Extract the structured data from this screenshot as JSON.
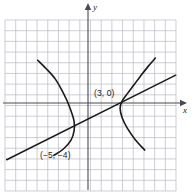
{
  "figure": {
    "title": "",
    "background_color": "#ffffff",
    "ink_color": "#1a1a1a",
    "grid_color": "#b9b9c4",
    "axis_color": "#4a4a52"
  },
  "axes": {
    "x_label": "x",
    "y_label": "y",
    "x_arrow": "arrow-right",
    "y_arrow": "arrow-up",
    "origin_px": {
      "x": 88,
      "y": 103
    },
    "unit_px": 10.7,
    "grid": {
      "visible": true,
      "left_px": 5,
      "top_px": 20,
      "right_px": 176,
      "bottom_px": 191,
      "columns": 16,
      "rows": 16
    }
  },
  "labels": [
    {
      "id": "point-a",
      "text": "(3, 0)"
    },
    {
      "id": "point-b",
      "text": "(−5, −4)"
    }
  ],
  "chart_data": {
    "type": "line",
    "title": "",
    "xlabel": "x",
    "ylabel": "y",
    "xlim": [
      -7.8,
      8.2
    ],
    "ylim": [
      -8.2,
      7.8
    ],
    "grid": true,
    "legend": "none",
    "annotations": [
      {
        "text": "(3, 0)",
        "x": 3,
        "y": 0
      },
      {
        "text": "(−5, −4)",
        "x": -5,
        "y": -4
      }
    ],
    "series": [
      {
        "name": "left-branch",
        "kind": "curve",
        "description": "leftward-opening curve, vertex near (-1.2, -1.5)",
        "points": [
          [
            -4.7,
            4.0
          ],
          [
            -3.9,
            3.2
          ],
          [
            -3.1,
            2.3
          ],
          [
            -2.5,
            1.3
          ],
          [
            -2.0,
            0.3
          ],
          [
            -1.6,
            -0.7
          ],
          [
            -1.3,
            -1.7
          ],
          [
            -1.3,
            -2.6
          ],
          [
            -1.6,
            -3.5
          ],
          [
            -2.3,
            -4.3
          ],
          [
            -3.2,
            -4.9
          ]
        ]
      },
      {
        "name": "right-branch",
        "kind": "curve",
        "description": "rightward-opening curve, vertex at (3, 0)",
        "points": [
          [
            6.3,
            4.2
          ],
          [
            5.6,
            3.4
          ],
          [
            4.9,
            2.5
          ],
          [
            4.3,
            1.7
          ],
          [
            3.7,
            0.9
          ],
          [
            3.2,
            0.2
          ],
          [
            3.0,
            -0.5
          ],
          [
            3.2,
            -1.4
          ],
          [
            3.7,
            -2.4
          ],
          [
            4.4,
            -3.4
          ],
          [
            5.3,
            -4.4
          ]
        ]
      },
      {
        "name": "straight-line",
        "kind": "line",
        "description": "line through (-5, -4) and (3, 0), slope 1/2",
        "points": [
          [
            -7.6,
            -5.3
          ],
          [
            8.2,
            2.6
          ]
        ]
      }
    ]
  }
}
